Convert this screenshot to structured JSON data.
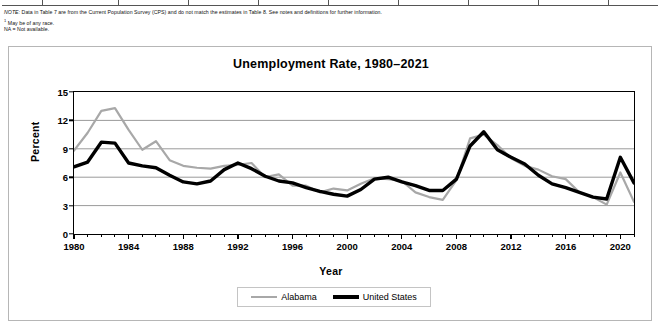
{
  "table_footer": {
    "note_prefix": "NOTE:",
    "note_text": " Data in Table 7 are from the Current Population Survey (CPS) and do not match the estimates in Table 8. See notes and definitions for further information.",
    "footnote_marker": "1",
    "footnote_1": " May be of any race.",
    "footnote_2": "NA = Not available.",
    "column_separators_x": [
      42,
      118,
      188,
      258,
      328,
      398,
      468,
      538,
      608
    ]
  },
  "chart_data": {
    "type": "line",
    "title": "Unemployment Rate, 1980–2021",
    "xlabel": "Year",
    "ylabel": "Percent",
    "xlim": [
      1980,
      2021
    ],
    "ylim": [
      0,
      15
    ],
    "yticks": [
      0,
      3,
      6,
      9,
      12,
      15
    ],
    "xticks": [
      1980,
      1984,
      1988,
      1992,
      1996,
      2000,
      2004,
      2008,
      2012,
      2016,
      2020
    ],
    "grid": "horizontal",
    "legend_position": "bottom-center",
    "x": [
      1980,
      1981,
      1982,
      1983,
      1984,
      1985,
      1986,
      1987,
      1988,
      1989,
      1990,
      1991,
      1992,
      1993,
      1994,
      1995,
      1996,
      1997,
      1998,
      1999,
      2000,
      2001,
      2002,
      2003,
      2004,
      2005,
      2006,
      2007,
      2008,
      2009,
      2010,
      2011,
      2012,
      2013,
      2014,
      2015,
      2016,
      2017,
      2018,
      2019,
      2020,
      2021
    ],
    "series": [
      {
        "name": "Alabama",
        "color": "#a8a8a8",
        "width": 2.2,
        "values": [
          8.8,
          10.7,
          13.0,
          13.3,
          11.0,
          8.9,
          9.8,
          7.8,
          7.2,
          7.0,
          6.9,
          7.2,
          7.3,
          7.5,
          6.0,
          6.3,
          5.1,
          5.1,
          4.4,
          4.8,
          4.6,
          5.3,
          5.9,
          5.8,
          5.6,
          4.4,
          3.9,
          3.6,
          5.7,
          10.1,
          10.5,
          9.4,
          8.0,
          7.2,
          6.8,
          6.1,
          5.8,
          4.4,
          3.9,
          3.1,
          6.5,
          3.4
        ]
      },
      {
        "name": "United States",
        "color": "#000000",
        "width": 3.4,
        "values": [
          7.1,
          7.6,
          9.7,
          9.6,
          7.5,
          7.2,
          7.0,
          6.2,
          5.5,
          5.3,
          5.6,
          6.8,
          7.5,
          6.9,
          6.1,
          5.6,
          5.4,
          4.9,
          4.5,
          4.2,
          4.0,
          4.7,
          5.8,
          6.0,
          5.5,
          5.1,
          4.6,
          4.6,
          5.8,
          9.3,
          10.8,
          8.9,
          8.1,
          7.4,
          6.2,
          5.3,
          4.9,
          4.4,
          3.9,
          3.7,
          8.1,
          5.4
        ]
      }
    ]
  }
}
